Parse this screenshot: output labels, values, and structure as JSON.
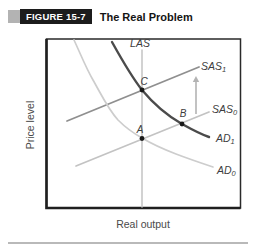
{
  "header": {
    "figure_label": "FIGURE 15-7",
    "title": "The Real Problem"
  },
  "chart_data": {
    "type": "line",
    "title": "The Real Problem",
    "xlabel": "Real output",
    "ylabel": "Price level",
    "axes": {
      "ticks": "none",
      "grid": false,
      "frame": true
    },
    "series": [
      {
        "name": "LAS",
        "label": "LAS",
        "sub": "",
        "color": "#c7c7c7",
        "width": 1.6,
        "d": "M142,50 L142,207",
        "label_x": 140,
        "label_y": 47,
        "label_anchor": "middle"
      },
      {
        "name": "SAS1",
        "label": "SAS",
        "sub": "1",
        "color": "#8f8f8f",
        "width": 1.8,
        "d": "M67,121 L199,67",
        "label_x": 201,
        "label_y": 70,
        "label_anchor": "start"
      },
      {
        "name": "SAS0",
        "label": "SAS",
        "sub": "0",
        "color": "#c3c3c3",
        "width": 1.7,
        "d": "M76,166 L209,112",
        "label_x": 212,
        "label_y": 113,
        "label_anchor": "start"
      },
      {
        "name": "AD1",
        "label": "AD",
        "sub": "1",
        "color": "#4b4b4b",
        "width": 2.4,
        "d": "M112,42 C122,60 131,76 142,90 C152,102 166,115 182,124 C191,129 200,134 209,137",
        "label_x": 216,
        "label_y": 142,
        "label_anchor": "start"
      },
      {
        "name": "AD0",
        "label": "AD",
        "sub": "0",
        "color": "#cdcdcd",
        "width": 1.7,
        "d": "M74,40 C81,55 86,68 93,80 C101,94 108,109 118,120 C126,128 133,133 142,138 C152,144 163,149 176,154 C189,159 201,163 213,167",
        "label_x": 217,
        "label_y": 174,
        "label_anchor": "start"
      }
    ],
    "points": [
      {
        "label": "A",
        "x": 142,
        "y": 138.5,
        "label_x": 140,
        "label_y": 133
      },
      {
        "label": "B",
        "x": 182,
        "y": 124,
        "label_x": 183,
        "label_y": 117
      },
      {
        "label": "C",
        "x": 142,
        "y": 90,
        "label_x": 144,
        "label_y": 85
      }
    ],
    "arrow": {
      "x": 196,
      "y_from": 114,
      "y_to": 76,
      "color": "#b3b3b3",
      "meaning": "SAS shifts up from SAS0 to SAS1"
    }
  },
  "colors": {
    "frame": "#222222",
    "dot": "#1a1a1a",
    "curve_label_text": "#3d3d3d",
    "axis_label_text": "#4a4a4a",
    "header_box": "#1c1c1c",
    "header_accent": "#b3b3b3",
    "bottom_rule": "#b9b9b9"
  }
}
